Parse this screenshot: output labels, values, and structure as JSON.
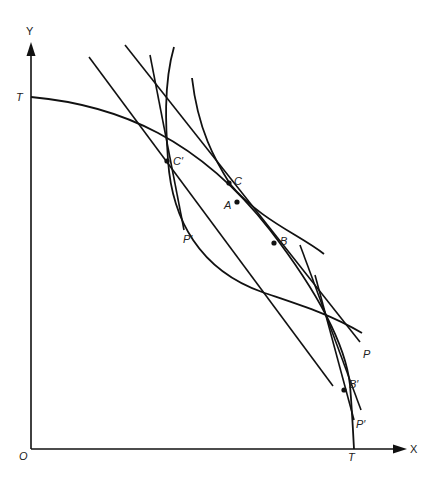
{
  "diagram": {
    "type": "production possibility frontier diagram",
    "axes": {
      "x_label": "X",
      "y_label": "Y",
      "origin_label": "O"
    },
    "frontier": {
      "label_y_intercept": "T",
      "label_x_intercept": "T"
    },
    "points": {
      "C": "C",
      "A": "A",
      "B": "B",
      "C_prime": "C′",
      "B_prime": "B′"
    },
    "price_lines": {
      "P": "P",
      "P_prime_upper": "P′",
      "P_prime_lower": "P′"
    }
  }
}
